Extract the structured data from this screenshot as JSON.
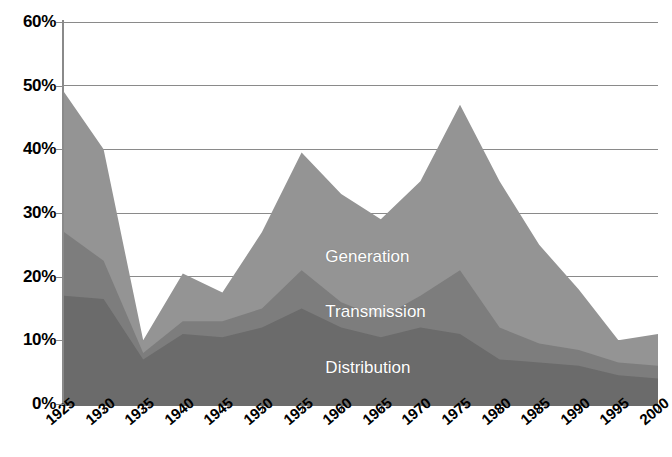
{
  "chart_data": {
    "type": "area",
    "stacked": true,
    "title": "",
    "subtitle": "",
    "xlabel": "",
    "ylabel": "",
    "categories": [
      "1925",
      "1930",
      "1935",
      "1940",
      "1945",
      "1950",
      "1955",
      "1960",
      "1965",
      "1970",
      "1975",
      "1980",
      "1985",
      "1990",
      "1995",
      "2000"
    ],
    "x": [
      1925,
      1930,
      1935,
      1940,
      1945,
      1950,
      1955,
      1960,
      1965,
      1970,
      1975,
      1980,
      1985,
      1990,
      1995,
      2000
    ],
    "xlim": [
      1925,
      2000
    ],
    "ylim": [
      0,
      60
    ],
    "y_tick_values": [
      0,
      10,
      20,
      30,
      40,
      50,
      60
    ],
    "y_tick_labels": [
      "0%",
      "10%",
      "20%",
      "30%",
      "40%",
      "50%",
      "60%"
    ],
    "x_tick_labels": [
      "1925",
      "1930",
      "1935",
      "1940",
      "1945",
      "1950",
      "1955",
      "1960",
      "1965",
      "1970",
      "1975",
      "1980",
      "1985",
      "1990",
      "1995",
      "2000"
    ],
    "grid": "horizontal",
    "legend_position": "inline-labels",
    "value_unit": "%",
    "series": [
      {
        "name": "Distribution",
        "color": "#6b6b6b",
        "stack_order": 1,
        "values": [
          17,
          16.5,
          7,
          11,
          10.5,
          12,
          15,
          12,
          10.5,
          12,
          11,
          7,
          6.5,
          6,
          4.5,
          4
        ]
      },
      {
        "name": "Transmission",
        "color": "#7d7d7d",
        "stack_order": 2,
        "values": [
          10,
          6,
          1,
          2,
          2.5,
          3,
          6,
          4,
          3,
          5,
          10,
          5,
          3,
          2.5,
          2,
          2
        ]
      },
      {
        "name": "Generation",
        "color": "#949494",
        "stack_order": 3,
        "values": [
          22,
          17.5,
          2,
          7.5,
          4.5,
          12,
          18.5,
          17,
          15.5,
          18,
          26,
          23,
          15.5,
          9.5,
          3.5,
          5
        ]
      }
    ],
    "cumulative": {
      "distribution_top": [
        17,
        16.5,
        7,
        11,
        10.5,
        12,
        15,
        12,
        10.5,
        12,
        11,
        7,
        6.5,
        6,
        4.5,
        4
      ],
      "transmission_top": [
        27,
        22.5,
        8,
        13,
        13,
        15,
        21,
        16,
        13.5,
        17,
        21,
        12,
        9.5,
        8.5,
        6.5,
        6
      ],
      "generation_top": [
        49,
        40,
        10,
        20.5,
        17.5,
        27,
        39.5,
        33,
        29,
        35,
        47,
        35,
        25,
        18,
        10,
        11
      ]
    },
    "annotations": [
      {
        "text": "Generation",
        "x": 1958,
        "y": 23,
        "color": "#ffffff"
      },
      {
        "text": "Transmission",
        "x": 1958,
        "y": 14.3,
        "color": "#ffffff"
      },
      {
        "text": "Distribution",
        "x": 1958,
        "y": 5.5,
        "color": "#ffffff"
      }
    ]
  },
  "axis": {
    "y_labels": [
      "60%",
      "50%",
      "40%",
      "30%",
      "20%",
      "10%",
      "0%"
    ],
    "x_labels": [
      "1925",
      "1930",
      "1935",
      "1940",
      "1945",
      "1950",
      "1955",
      "1960",
      "1965",
      "1970",
      "1975",
      "1980",
      "1985",
      "1990",
      "1995",
      "2000"
    ]
  },
  "series_labels": {
    "generation": "Generation",
    "transmission": "Transmission",
    "distribution": "Distribution"
  },
  "colors": {
    "generation": "#949494",
    "transmission": "#7d7d7d",
    "distribution": "#6b6b6b",
    "gridline": "#8a8a8a",
    "axis": "#6b6b6b",
    "background": "#ffffff",
    "text": "#000000",
    "label_text": "#ffffff"
  }
}
